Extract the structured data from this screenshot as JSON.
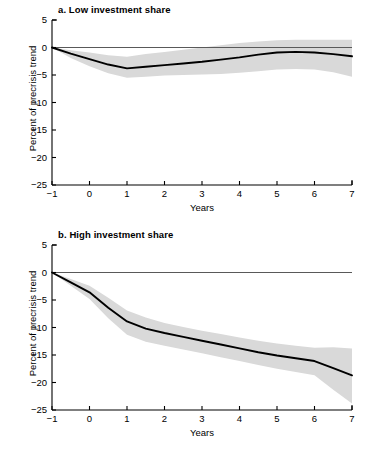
{
  "figure": {
    "panels": [
      {
        "id": "a",
        "title": "a. Low investment share",
        "xlabel": "Years",
        "ylabel": "Percent of precrisis trend"
      },
      {
        "id": "b",
        "title": "b. High investment share",
        "xlabel": "Years",
        "ylabel": "Percent of precrisis trend"
      }
    ],
    "xticks": [
      "−1",
      "0",
      "1",
      "2",
      "3",
      "4",
      "5",
      "6",
      "7"
    ],
    "yticks": [
      "5",
      "0",
      "−5",
      "−10",
      "−15",
      "−20",
      "−25"
    ],
    "colors": {
      "line": "#000000",
      "band": "#d9d9d9",
      "axis": "#000000",
      "zero_line": "#595959",
      "background": "#ffffff"
    }
  },
  "chart_data": [
    {
      "type": "line",
      "title": "a. Low investment share",
      "xlabel": "Years",
      "ylabel": "Percent of precrisis trend",
      "xlim": [
        -1,
        7
      ],
      "ylim": [
        -25,
        5
      ],
      "xticks": [
        -1,
        0,
        1,
        2,
        3,
        4,
        5,
        6,
        7
      ],
      "yticks": [
        5,
        0,
        -5,
        -10,
        -15,
        -20,
        -25
      ],
      "grid": false,
      "legend": "none",
      "x": [
        -1,
        -0.5,
        0,
        0.5,
        1,
        1.5,
        2,
        2.5,
        3,
        3.5,
        4,
        4.5,
        5,
        5.5,
        6,
        6.5,
        7
      ],
      "series": [
        {
          "name": "Point estimate",
          "values": [
            0,
            -1.1,
            -2.1,
            -3.1,
            -3.8,
            -3.5,
            -3.2,
            -2.9,
            -2.6,
            -2.2,
            -1.8,
            -1.3,
            -0.9,
            -0.8,
            -0.9,
            -1.2,
            -1.6
          ]
        },
        {
          "name": "Confidence band upper",
          "values": [
            0,
            -0.5,
            -0.9,
            -1.4,
            -1.7,
            -1.2,
            -0.8,
            -0.4,
            0.0,
            0.4,
            0.8,
            1.1,
            1.3,
            1.4,
            1.4,
            1.4,
            1.4
          ]
        },
        {
          "name": "Confidence band lower",
          "values": [
            0,
            -1.9,
            -3.4,
            -4.7,
            -5.5,
            -5.3,
            -5.1,
            -5.0,
            -4.9,
            -4.8,
            -4.6,
            -4.3,
            -4.0,
            -3.9,
            -4.0,
            -4.5,
            -5.3
          ]
        },
        {
          "name": "Zero reference",
          "values": [
            0,
            0,
            0,
            0,
            0,
            0,
            0,
            0,
            0,
            0,
            0,
            0,
            0,
            0,
            0,
            0,
            0
          ]
        }
      ]
    },
    {
      "type": "line",
      "title": "b. High investment share",
      "xlabel": "Years",
      "ylabel": "Percent of precrisis trend",
      "xlim": [
        -1,
        7
      ],
      "ylim": [
        -25,
        5
      ],
      "xticks": [
        -1,
        0,
        1,
        2,
        3,
        4,
        5,
        6,
        7
      ],
      "yticks": [
        5,
        0,
        -5,
        -10,
        -15,
        -20,
        -25
      ],
      "grid": false,
      "legend": "none",
      "x": [
        -1,
        -0.5,
        0,
        0.5,
        1,
        1.5,
        2,
        2.5,
        3,
        3.5,
        4,
        4.5,
        5,
        5.5,
        6,
        6.5,
        7
      ],
      "series": [
        {
          "name": "Point estimate",
          "values": [
            0,
            -1.8,
            -3.6,
            -6.4,
            -8.9,
            -10.2,
            -11.0,
            -11.7,
            -12.4,
            -13.1,
            -13.8,
            -14.5,
            -15.1,
            -15.6,
            -16.1,
            -17.4,
            -18.7
          ]
        },
        {
          "name": "Confidence band upper",
          "values": [
            0,
            -1.2,
            -2.4,
            -4.6,
            -6.9,
            -8.2,
            -9.2,
            -9.9,
            -10.6,
            -11.2,
            -11.8,
            -12.4,
            -12.9,
            -13.3,
            -13.7,
            -13.6,
            -13.8
          ]
        },
        {
          "name": "Confidence band lower",
          "values": [
            0,
            -2.4,
            -4.8,
            -8.3,
            -11.3,
            -12.6,
            -13.3,
            -14.0,
            -14.7,
            -15.4,
            -16.1,
            -16.8,
            -17.5,
            -18.1,
            -18.7,
            -21.3,
            -23.8
          ]
        },
        {
          "name": "Zero reference",
          "values": [
            0,
            0,
            0,
            0,
            0,
            0,
            0,
            0,
            0,
            0,
            0,
            0,
            0,
            0,
            0,
            0,
            0
          ]
        }
      ]
    }
  ]
}
